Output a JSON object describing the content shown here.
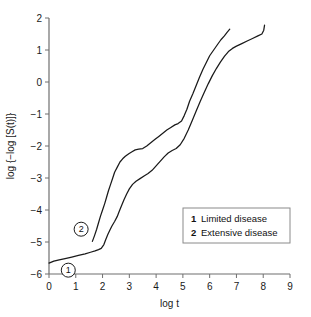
{
  "chart_data": {
    "type": "line",
    "title": "",
    "xlabel": "log t",
    "ylabel": "log {−log [S(t)]}",
    "xlim": [
      0,
      9
    ],
    "ylim": [
      -6,
      2
    ],
    "xticks": [
      "0",
      "1",
      "2",
      "3",
      "4",
      "5",
      "6",
      "7",
      "8",
      "9"
    ],
    "yticks": [
      "2",
      "1",
      "0",
      "−1",
      "−2",
      "−3",
      "−4",
      "−5",
      "−6"
    ],
    "grid": false,
    "legend_position": "lower-right",
    "series": [
      {
        "name": "Limited disease",
        "key": "1",
        "marker_label": "1",
        "marker_x": 0.72,
        "marker_y": -5.88,
        "points": [
          [
            0.0,
            -5.66
          ],
          [
            0.18,
            -5.6
          ],
          [
            0.38,
            -5.56
          ],
          [
            0.6,
            -5.52
          ],
          [
            0.85,
            -5.47
          ],
          [
            1.1,
            -5.42
          ],
          [
            1.35,
            -5.37
          ],
          [
            1.55,
            -5.32
          ],
          [
            1.72,
            -5.28
          ],
          [
            1.85,
            -5.24
          ],
          [
            1.95,
            -5.2
          ],
          [
            2.05,
            -5.08
          ],
          [
            2.12,
            -4.92
          ],
          [
            2.2,
            -4.76
          ],
          [
            2.28,
            -4.62
          ],
          [
            2.35,
            -4.5
          ],
          [
            2.45,
            -4.36
          ],
          [
            2.55,
            -4.2
          ],
          [
            2.62,
            -4.05
          ],
          [
            2.7,
            -3.88
          ],
          [
            2.8,
            -3.68
          ],
          [
            2.9,
            -3.5
          ],
          [
            3.0,
            -3.34
          ],
          [
            3.12,
            -3.2
          ],
          [
            3.25,
            -3.1
          ],
          [
            3.4,
            -3.02
          ],
          [
            3.55,
            -2.94
          ],
          [
            3.7,
            -2.86
          ],
          [
            3.85,
            -2.76
          ],
          [
            4.0,
            -2.62
          ],
          [
            4.15,
            -2.48
          ],
          [
            4.3,
            -2.34
          ],
          [
            4.45,
            -2.22
          ],
          [
            4.6,
            -2.14
          ],
          [
            4.75,
            -2.08
          ],
          [
            4.9,
            -1.96
          ],
          [
            5.05,
            -1.76
          ],
          [
            5.2,
            -1.5
          ],
          [
            5.35,
            -1.2
          ],
          [
            5.5,
            -0.9
          ],
          [
            5.65,
            -0.6
          ],
          [
            5.8,
            -0.32
          ],
          [
            5.95,
            -0.05
          ],
          [
            6.1,
            0.2
          ],
          [
            6.25,
            0.42
          ],
          [
            6.4,
            0.62
          ],
          [
            6.55,
            0.8
          ],
          [
            6.7,
            0.95
          ],
          [
            6.85,
            1.05
          ],
          [
            7.0,
            1.12
          ],
          [
            7.2,
            1.2
          ],
          [
            7.4,
            1.28
          ],
          [
            7.6,
            1.36
          ],
          [
            7.8,
            1.44
          ],
          [
            7.95,
            1.5
          ],
          [
            8.02,
            1.62
          ],
          [
            8.05,
            1.78
          ]
        ]
      },
      {
        "name": "Extensive disease",
        "key": "2",
        "marker_label": "2",
        "marker_x": 1.2,
        "marker_y": -4.6,
        "points": [
          [
            1.62,
            -4.98
          ],
          [
            1.7,
            -4.8
          ],
          [
            1.78,
            -4.6
          ],
          [
            1.85,
            -4.4
          ],
          [
            1.92,
            -4.2
          ],
          [
            2.0,
            -4.0
          ],
          [
            2.08,
            -3.8
          ],
          [
            2.15,
            -3.6
          ],
          [
            2.22,
            -3.4
          ],
          [
            2.3,
            -3.2
          ],
          [
            2.38,
            -3.0
          ],
          [
            2.45,
            -2.82
          ],
          [
            2.55,
            -2.66
          ],
          [
            2.65,
            -2.5
          ],
          [
            2.75,
            -2.4
          ],
          [
            2.85,
            -2.32
          ],
          [
            2.98,
            -2.24
          ],
          [
            3.1,
            -2.18
          ],
          [
            3.22,
            -2.12
          ],
          [
            3.35,
            -2.1
          ],
          [
            3.5,
            -2.08
          ],
          [
            3.65,
            -2.0
          ],
          [
            3.8,
            -1.9
          ],
          [
            3.95,
            -1.8
          ],
          [
            4.1,
            -1.7
          ],
          [
            4.25,
            -1.6
          ],
          [
            4.4,
            -1.5
          ],
          [
            4.55,
            -1.42
          ],
          [
            4.7,
            -1.34
          ],
          [
            4.82,
            -1.3
          ],
          [
            4.95,
            -1.22
          ],
          [
            5.05,
            -1.05
          ],
          [
            5.15,
            -0.85
          ],
          [
            5.25,
            -0.6
          ],
          [
            5.38,
            -0.35
          ],
          [
            5.5,
            -0.1
          ],
          [
            5.62,
            0.15
          ],
          [
            5.75,
            0.4
          ],
          [
            5.88,
            0.62
          ],
          [
            6.0,
            0.82
          ],
          [
            6.15,
            1.0
          ],
          [
            6.3,
            1.18
          ],
          [
            6.42,
            1.32
          ],
          [
            6.55,
            1.44
          ],
          [
            6.65,
            1.55
          ],
          [
            6.75,
            1.65
          ]
        ]
      }
    ],
    "legend": [
      {
        "key": "1",
        "label": "Limited disease"
      },
      {
        "key": "2",
        "label": "Extensive disease"
      }
    ]
  }
}
